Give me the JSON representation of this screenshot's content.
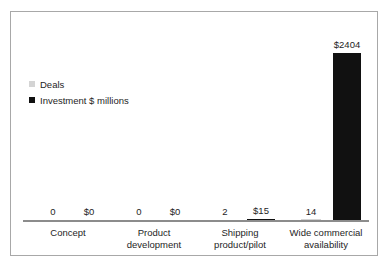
{
  "chart_data": {
    "type": "bar",
    "title": "",
    "subtitle": "",
    "xlabel": "",
    "ylabel": "",
    "grid": false,
    "legend_position": "upper-left",
    "categories": [
      "Concept",
      "Product development",
      "Shipping product/pilot",
      "Wide commercial availability"
    ],
    "category_lines": [
      [
        "Concept",
        ""
      ],
      [
        "Product",
        "development"
      ],
      [
        "Shipping",
        "product/pilot"
      ],
      [
        "Wide commercial",
        "availability"
      ]
    ],
    "series": [
      {
        "name": "Deals",
        "color": "#d4d4d4",
        "values": [
          0,
          0,
          2,
          14
        ],
        "labels": [
          "0",
          "0",
          "2",
          "14"
        ]
      },
      {
        "name": "Investment $ millions",
        "color": "#111111",
        "values": [
          0,
          0,
          15,
          2404
        ],
        "labels": [
          "$0",
          "$0",
          "$15",
          "$2404"
        ]
      }
    ],
    "ylim": [
      0,
      2404
    ]
  },
  "legend": {
    "items": [
      {
        "label": "Deals",
        "color": "#d4d4d4"
      },
      {
        "label": "Investment $ millions",
        "color": "#111111"
      }
    ]
  },
  "columns": [
    {
      "cat_line1": "Concept",
      "cat_line2": "",
      "deals_label": "0",
      "invest_label": "$0"
    },
    {
      "cat_line1": "Product",
      "cat_line2": "development",
      "deals_label": "0",
      "invest_label": "$0"
    },
    {
      "cat_line1": "Shipping",
      "cat_line2": "product/pilot",
      "deals_label": "2",
      "invest_label": "$15"
    },
    {
      "cat_line1": "Wide commercial",
      "cat_line2": "availability",
      "deals_label": "14",
      "invest_label": "$2404"
    }
  ]
}
